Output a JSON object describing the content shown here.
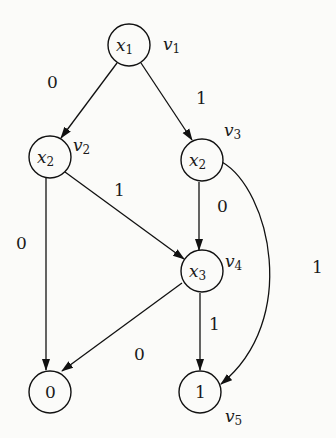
{
  "diagram": {
    "type": "binary decision diagram",
    "nodes": [
      {
        "id": "v1",
        "var": "x",
        "sub": "1",
        "name": "v",
        "name_sub": "1",
        "cx": 129,
        "cy": 45
      },
      {
        "id": "v2",
        "var": "x",
        "sub": "2",
        "name": "v",
        "name_sub": "2",
        "cx": 50,
        "cy": 157
      },
      {
        "id": "v3",
        "var": "x",
        "sub": "2",
        "name": "v",
        "name_sub": "3",
        "cx": 202,
        "cy": 160
      },
      {
        "id": "v4",
        "var": "x",
        "sub": "3",
        "name": "v",
        "name_sub": "4",
        "cx": 202,
        "cy": 271
      },
      {
        "id": "t0",
        "terminal": "0",
        "cx": 50,
        "cy": 392
      },
      {
        "id": "v5",
        "terminal": "1",
        "name": "v",
        "name_sub": "5",
        "cx": 200,
        "cy": 392
      }
    ],
    "edges": [
      {
        "from": "v1",
        "to": "v2",
        "label": "0"
      },
      {
        "from": "v1",
        "to": "v3",
        "label": "1"
      },
      {
        "from": "v2",
        "to": "t0",
        "label": "0"
      },
      {
        "from": "v2",
        "to": "v4",
        "label": "1"
      },
      {
        "from": "v3",
        "to": "v4",
        "label": "0"
      },
      {
        "from": "v3",
        "to": "v5",
        "label": "1"
      },
      {
        "from": "v4",
        "to": "t0",
        "label": "0"
      },
      {
        "from": "v4",
        "to": "v5",
        "label": "1"
      }
    ]
  }
}
